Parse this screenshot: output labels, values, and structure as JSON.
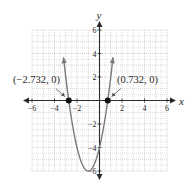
{
  "chart_data": {
    "type": "line",
    "title": "",
    "xlabel": "x",
    "ylabel": "y",
    "xlim": [
      -6,
      6
    ],
    "ylim": [
      -6,
      6
    ],
    "grid": true,
    "x_ticks": [
      -6,
      -4,
      -2,
      2,
      4,
      6
    ],
    "y_ticks": [
      6,
      4,
      2,
      -2,
      -4,
      -6
    ],
    "x_tick_labels": [
      "−6",
      "−4",
      "−2",
      "2",
      "4",
      "6"
    ],
    "y_tick_labels": [
      "6",
      "4",
      "2",
      "−2",
      "−4",
      "−6"
    ],
    "function": "y = 2x^2 + 4x - 4",
    "series": [
      {
        "name": "parabola",
        "vertex": [
          -1,
          -6
        ],
        "y_intercept": -4,
        "x": [
          -3.2,
          -3,
          -2.732,
          -2.5,
          -2,
          -1.5,
          -1,
          -0.5,
          0,
          0.5,
          0.732,
          1,
          1.2
        ],
        "y": [
          6.08,
          2,
          0,
          -1.5,
          -4,
          -5.5,
          -6,
          -5.5,
          -4,
          -1.5,
          0,
          2,
          3.68
        ]
      }
    ],
    "annotations": [
      {
        "point": [
          -2.732,
          0
        ],
        "label": "(−2.732, 0)"
      },
      {
        "point": [
          0.732,
          0
        ],
        "label": "(0.732, 0)"
      }
    ],
    "colors": {
      "curve": "#7a7a7a",
      "axis": "#2a2a2a",
      "grid": "#c8c8c8",
      "point": "#111111"
    }
  }
}
